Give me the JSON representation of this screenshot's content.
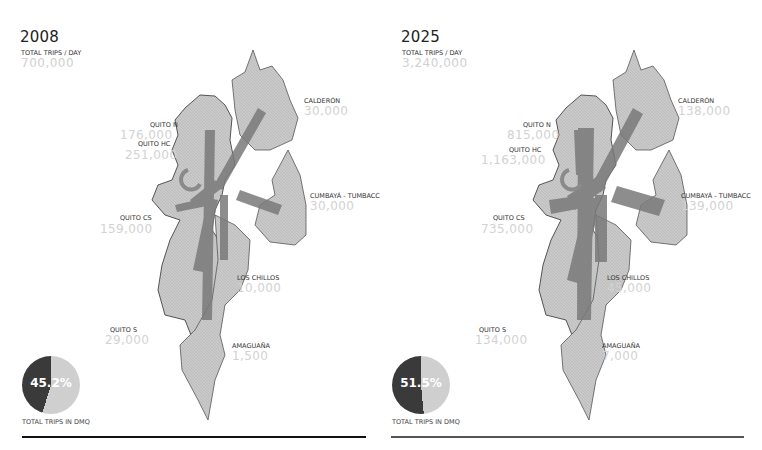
{
  "panels": [
    {
      "year": "2008",
      "total_label": "TOTAL TRIPS / DAY",
      "total_value": "700,000",
      "zones": [
        {
          "name": "QUITO N",
          "value": "176,000"
        },
        {
          "name": "QUITO HC",
          "value": "251,000"
        },
        {
          "name": "QUITO CS",
          "value": "159,000"
        },
        {
          "name": "QUITO S",
          "value": "29,000"
        },
        {
          "name": "CALDERÓN",
          "value": "30,000"
        },
        {
          "name": "CUMBAYÁ - TUMBACC",
          "value": "30,000"
        },
        {
          "name": "LOS CHILLOS",
          "value": "10,000"
        },
        {
          "name": "AMAGUAÑA",
          "value": "1,500"
        }
      ],
      "pie": {
        "percent_label": "45.2%",
        "percent": 45.2,
        "caption": "TOTAL TRIPS IN DMQ"
      },
      "rule_color": "#111111"
    },
    {
      "year": "2025",
      "total_label": "TOTAL TRIPS / DAY",
      "total_value": "3,240,000",
      "zones": [
        {
          "name": "QUITO N",
          "value": "815,000"
        },
        {
          "name": "QUITO HC",
          "value": "1,163,000"
        },
        {
          "name": "QUITO CS",
          "value": "735,000"
        },
        {
          "name": "QUITO S",
          "value": "134,000"
        },
        {
          "name": "CALDERÓN",
          "value": "138,000"
        },
        {
          "name": "CUMBAYÁ - TUMBACC",
          "value": "139,000"
        },
        {
          "name": "LOS CHILLOS",
          "value": "45,000"
        },
        {
          "name": "AMAGUAÑA",
          "value": "7,000"
        }
      ],
      "pie": {
        "percent_label": "51.5%",
        "percent": 51.5,
        "caption": "TOTAL TRIPS IN DMQ"
      },
      "rule_color": "#555555"
    }
  ],
  "colors": {
    "land": "#c8c8c8",
    "land_stroke": "#555555",
    "flow_arrow": "#7a7a7a",
    "value_text": "#d2d2d2",
    "pie_dark": "#3a3a3a",
    "pie_light": "#cfcfcf"
  }
}
